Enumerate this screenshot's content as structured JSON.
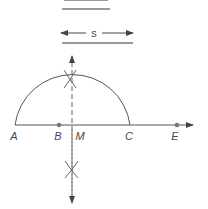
{
  "diagram": {
    "segments": [
      {
        "id": "top-segment",
        "label": "",
        "note": "partially cropped at top"
      },
      {
        "id": "s-segment",
        "label": "s"
      }
    ],
    "points": [
      {
        "name": "A",
        "label": "A"
      },
      {
        "name": "B",
        "label": "B"
      },
      {
        "name": "M",
        "label": "M"
      },
      {
        "name": "C",
        "label": "C"
      },
      {
        "name": "E",
        "label": "E"
      }
    ],
    "colors": {
      "stroke": "#555555",
      "dot": "#777777",
      "text": "#4a4a4a"
    }
  }
}
